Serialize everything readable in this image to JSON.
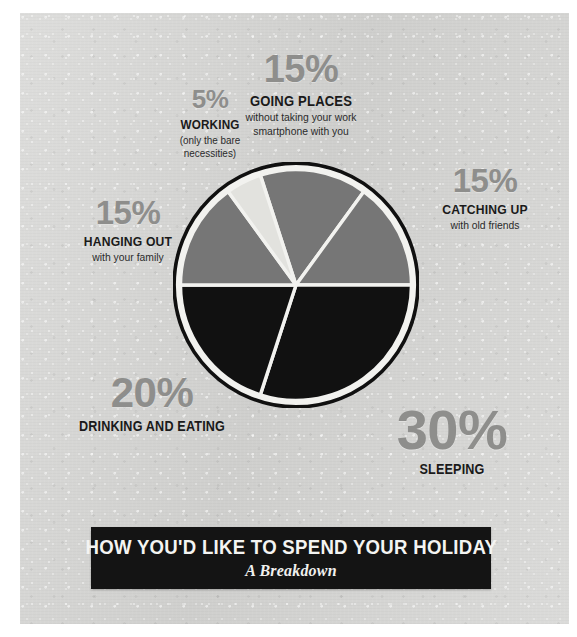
{
  "banner": {
    "title": "HOW YOU'D LIKE TO SPEND YOUR HOLIDAY",
    "subtitle": "A Breakdown"
  },
  "colors": {
    "panel_background": "#d4d4d2",
    "slice_mid_gray": "#767676",
    "slice_black": "#111111",
    "slice_light": "#e2e2de",
    "percent_text": "#8e8e8c",
    "caption_text": "#1a1a1a",
    "banner_background": "#141414",
    "banner_text": "#f4f4f2",
    "separator": "#f2f2ef",
    "pie_ring": "#101010"
  },
  "labels": {
    "working": {
      "percent": "5%",
      "caption": "WORKING",
      "sub": "(only the bare\nnecessities)"
    },
    "going": {
      "percent": "15%",
      "caption": "GOING PLACES",
      "sub": "without taking your work\nsmartphone with you"
    },
    "catching": {
      "percent": "15%",
      "caption": "CATCHING UP",
      "sub": "with old friends"
    },
    "hanging": {
      "percent": "15%",
      "caption": "HANGING OUT",
      "sub": "with your family"
    },
    "drinking": {
      "percent": "20%",
      "caption": "DRINKING AND EATING",
      "sub": ""
    },
    "sleeping": {
      "percent": "30%",
      "caption": "SLEEPING",
      "sub": ""
    }
  },
  "chart_data": {
    "type": "pie",
    "title": "HOW YOU'D LIKE TO SPEND YOUR HOLIDAY",
    "subtitle": "A Breakdown",
    "unit": "percent",
    "total": 100,
    "legend": "outside-labels",
    "start_angle_deg": -18,
    "direction": "clockwise",
    "categories": [
      "GOING PLACES",
      "CATCHING UP",
      "SLEEPING",
      "DRINKING AND EATING",
      "HANGING OUT",
      "WORKING"
    ],
    "values": [
      15,
      15,
      30,
      20,
      15,
      5
    ],
    "slices": [
      {
        "label": "GOING PLACES",
        "value": 15,
        "color": "#767676",
        "sub": "without taking your work smartphone with you"
      },
      {
        "label": "CATCHING UP",
        "value": 15,
        "color": "#767676",
        "sub": "with old friends"
      },
      {
        "label": "SLEEPING",
        "value": 30,
        "color": "#111111",
        "sub": ""
      },
      {
        "label": "DRINKING AND EATING",
        "value": 20,
        "color": "#111111",
        "sub": ""
      },
      {
        "label": "HANGING OUT",
        "value": 15,
        "color": "#767676",
        "sub": "with your family"
      },
      {
        "label": "WORKING",
        "value": 5,
        "color": "#e2e2de",
        "sub": "(only the bare necessities)"
      }
    ]
  }
}
